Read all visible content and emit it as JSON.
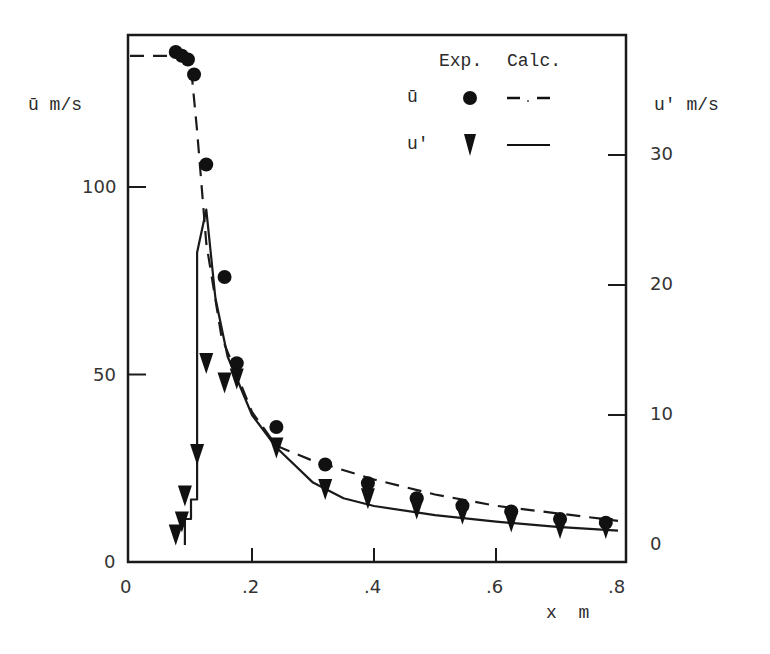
{
  "chart_data": {
    "type": "scatter",
    "title": "",
    "xlabel": "x  m",
    "ylabel": "ū m/s",
    "ylabel_right": "u' m/s",
    "xlim": [
      0,
      0.8
    ],
    "ylim": [
      0,
      145
    ],
    "ylim_right": [
      0,
      37
    ],
    "grid": false,
    "x_ticks": [
      0,
      0.2,
      0.4,
      0.6,
      0.8
    ],
    "x_tick_labels": [
      "0",
      ".2",
      ".4",
      ".6",
      ".8"
    ],
    "y_ticks": [
      0,
      50,
      100
    ],
    "y_tick_labels": [
      "0",
      "50",
      "100"
    ],
    "y_right_ticks": [
      0,
      10,
      20,
      30
    ],
    "y_right_tick_labels": [
      "0",
      "10",
      "20",
      "30"
    ],
    "legend": {
      "position": "upper right",
      "header": [
        "Exp.",
        "Calc."
      ],
      "entries": [
        {
          "label": "ū",
          "exp_marker": "circle",
          "calc_line": "dash-dot"
        },
        {
          "label": "u'",
          "exp_marker": "triangle-down",
          "calc_line": "solid"
        }
      ]
    },
    "series": [
      {
        "name": "ū Exp.",
        "axis": "left",
        "marker": "circle",
        "x": [
          0.075,
          0.085,
          0.095,
          0.105,
          0.125,
          0.155,
          0.175,
          0.24,
          0.32,
          0.39,
          0.47,
          0.545,
          0.625,
          0.705,
          0.78
        ],
        "y": [
          136,
          135,
          134,
          130,
          106,
          76,
          53,
          36,
          26,
          21,
          17,
          15,
          13.5,
          11.5,
          10.5
        ]
      },
      {
        "name": "ū Calc.",
        "axis": "left",
        "style": "dash-dot",
        "x": [
          0,
          0.08,
          0.1,
          0.11,
          0.125,
          0.15,
          0.2,
          0.24,
          0.3,
          0.4,
          0.5,
          0.6,
          0.7,
          0.8
        ],
        "y": [
          135,
          135,
          132,
          115,
          85,
          60,
          40,
          31,
          27,
          22,
          18,
          15,
          13,
          11
        ]
      },
      {
        "name": "u' Exp.",
        "axis": "right",
        "marker": "triangle-down",
        "x": [
          0.075,
          0.085,
          0.09,
          0.11,
          0.125,
          0.155,
          0.175,
          0.24,
          0.32,
          0.39,
          0.47,
          0.545,
          0.625,
          0.705,
          0.78
        ],
        "y": [
          0.8,
          1.8,
          3.8,
          7.0,
          14.0,
          12.5,
          12.8,
          7.5,
          4.3,
          3.6,
          2.8,
          2.4,
          1.8,
          1.3,
          1.3
        ]
      },
      {
        "name": "u' Calc.",
        "axis": "right",
        "style": "solid",
        "x": [
          0.09,
          0.09,
          0.1,
          0.1,
          0.11,
          0.11,
          0.125,
          0.14,
          0.16,
          0.2,
          0.24,
          0.3,
          0.35,
          0.4,
          0.5,
          0.6,
          0.7,
          0.8
        ],
        "y": [
          0,
          2.0,
          2.0,
          3.5,
          3.5,
          22.5,
          25.8,
          19.0,
          14.5,
          10.0,
          7.5,
          4.8,
          3.6,
          3.0,
          2.3,
          1.8,
          1.4,
          1.1
        ]
      }
    ]
  }
}
